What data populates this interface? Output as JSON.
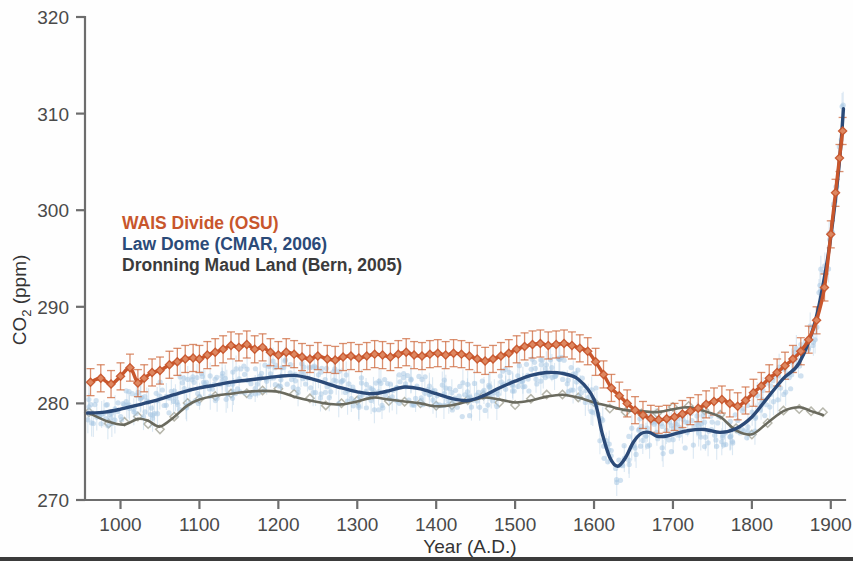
{
  "chart_data": {
    "type": "line",
    "title": "",
    "xlabel": "Year  (A.D.)",
    "ylabel": "CO 2 (ppm)",
    "ylabel_main": "CO",
    "ylabel_sub": "2",
    "ylabel_unit": " (ppm)",
    "xlim": [
      955,
      1918
    ],
    "ylim": [
      270,
      320
    ],
    "yticks": [
      270,
      280,
      290,
      300,
      310,
      320
    ],
    "xticks": [
      1000,
      1100,
      1200,
      1300,
      1400,
      1500,
      1600,
      1700,
      1800,
      1900
    ],
    "grid": false,
    "legend_position": "upper-left-inside",
    "colors": {
      "wais": "#C8562C",
      "wais_marker": "#CF6A3E",
      "lawdome_line": "#2B4A78",
      "lawdome_points": "#A9C9E4",
      "dml_line": "#6A6A5E",
      "dml_points": "#A9A99C",
      "axis": "#6D6D6D",
      "text": "#3A3A3A"
    },
    "series": [
      {
        "name": "WAIS Divide (OSU)",
        "short": "wais",
        "color": "#C8562C",
        "style": "markers-errorbars-smoothline",
        "marker": "diamond",
        "errorbar_ppm": 1.4,
        "x": [
          962,
          975,
          988,
          1000,
          1012,
          1022,
          1030,
          1040,
          1050,
          1062,
          1072,
          1082,
          1092,
          1100,
          1110,
          1120,
          1130,
          1140,
          1150,
          1160,
          1170,
          1180,
          1190,
          1200,
          1210,
          1220,
          1230,
          1240,
          1250,
          1262,
          1272,
          1282,
          1292,
          1302,
          1312,
          1322,
          1332,
          1342,
          1352,
          1362,
          1372,
          1382,
          1392,
          1402,
          1412,
          1422,
          1432,
          1442,
          1452,
          1462,
          1472,
          1482,
          1492,
          1502,
          1512,
          1522,
          1532,
          1542,
          1552,
          1562,
          1572,
          1582,
          1592,
          1602,
          1612,
          1622,
          1632,
          1642,
          1652,
          1662,
          1672,
          1682,
          1692,
          1702,
          1712,
          1722,
          1732,
          1742,
          1752,
          1762,
          1772,
          1782,
          1792,
          1802,
          1812,
          1822,
          1832,
          1842,
          1852,
          1862,
          1872,
          1882,
          1892,
          1900,
          1906,
          1911,
          1915
        ],
        "y": [
          282.2,
          282.6,
          282.0,
          282.8,
          283.7,
          282.1,
          282.6,
          283.2,
          283.4,
          284.0,
          284.3,
          284.6,
          284.7,
          284.6,
          285.0,
          285.3,
          285.6,
          286.0,
          285.8,
          286.1,
          285.6,
          285.8,
          285.3,
          285.0,
          285.3,
          285.1,
          284.8,
          284.6,
          284.9,
          284.6,
          284.5,
          284.8,
          284.9,
          284.7,
          284.9,
          285.1,
          285.0,
          284.8,
          285.1,
          285.3,
          285.0,
          284.9,
          285.1,
          285.2,
          285.0,
          285.2,
          285.1,
          284.9,
          284.6,
          284.4,
          284.6,
          284.9,
          285.2,
          285.6,
          285.9,
          286.1,
          286.2,
          286.0,
          286.1,
          286.2,
          286.0,
          285.7,
          285.4,
          284.3,
          283.0,
          281.6,
          280.8,
          280.0,
          279.3,
          278.8,
          278.4,
          278.3,
          278.4,
          278.6,
          278.9,
          279.2,
          279.5,
          279.9,
          280.2,
          280.4,
          280.0,
          279.7,
          280.3,
          281.1,
          281.8,
          282.6,
          283.2,
          283.9,
          284.6,
          285.4,
          286.6,
          288.6,
          292.0,
          297.5,
          301.8,
          305.4,
          308.2
        ]
      },
      {
        "name": "Law Dome (CMAR, 2006)",
        "short": "lawdome",
        "color": "#2B4A78",
        "style": "scatter-with-smoothline",
        "marker": "dot",
        "x": [
          958,
          980,
          1000,
          1020,
          1040,
          1060,
          1080,
          1100,
          1120,
          1140,
          1160,
          1180,
          1200,
          1220,
          1240,
          1260,
          1280,
          1300,
          1320,
          1340,
          1360,
          1380,
          1400,
          1420,
          1440,
          1460,
          1480,
          1500,
          1520,
          1540,
          1560,
          1580,
          1600,
          1610,
          1620,
          1630,
          1640,
          1650,
          1660,
          1670,
          1680,
          1690,
          1700,
          1720,
          1740,
          1760,
          1780,
          1800,
          1820,
          1840,
          1860,
          1880,
          1895,
          1905,
          1912,
          1916
        ],
        "y": [
          279.0,
          279.1,
          279.4,
          279.8,
          280.2,
          280.7,
          281.2,
          281.6,
          281.9,
          282.2,
          282.4,
          282.6,
          282.8,
          282.9,
          282.6,
          282.1,
          281.6,
          281.2,
          281.0,
          281.3,
          281.7,
          281.5,
          281.0,
          280.5,
          280.3,
          280.8,
          281.6,
          282.3,
          282.9,
          283.2,
          283.1,
          282.5,
          280.4,
          277.0,
          274.4,
          273.5,
          274.4,
          276.0,
          276.9,
          277.0,
          276.6,
          276.6,
          276.8,
          277.2,
          277.3,
          277.0,
          277.4,
          278.6,
          280.6,
          282.6,
          284.2,
          288.4,
          294.5,
          300.5,
          306.0,
          310.5
        ]
      },
      {
        "name": "Dronning Maud Land (Bern, 2005)",
        "short": "dml",
        "color": "#6A6A5E",
        "style": "markers-with-smoothline",
        "marker": "open-diamond",
        "x": [
          960,
          985,
          1005,
          1022,
          1035,
          1050,
          1068,
          1085,
          1100,
          1120,
          1140,
          1160,
          1180,
          1200,
          1220,
          1240,
          1260,
          1280,
          1300,
          1320,
          1340,
          1360,
          1380,
          1400,
          1420,
          1440,
          1460,
          1480,
          1500,
          1520,
          1540,
          1560,
          1580,
          1600,
          1620,
          1640,
          1660,
          1680,
          1700,
          1720,
          1740,
          1760,
          1780,
          1800,
          1820,
          1840,
          1860,
          1875,
          1890
        ],
        "y": [
          279.0,
          278.1,
          277.8,
          278.4,
          278.2,
          277.6,
          278.6,
          279.8,
          280.4,
          280.8,
          281.0,
          281.2,
          281.3,
          281.2,
          280.7,
          280.3,
          280.0,
          279.9,
          280.2,
          280.6,
          280.4,
          280.2,
          280.0,
          279.7,
          279.8,
          280.2,
          280.6,
          280.4,
          280.1,
          280.3,
          280.7,
          280.9,
          280.6,
          280.1,
          279.7,
          279.3,
          279.2,
          279.1,
          279.4,
          279.6,
          279.2,
          278.6,
          277.2,
          276.8,
          278.0,
          279.2,
          279.6,
          279.2,
          278.8
        ]
      }
    ]
  },
  "legend": {
    "entries": [
      {
        "label": "WAIS Divide (OSU)",
        "color": "#C8562C"
      },
      {
        "label": "Law Dome (CMAR, 2006)",
        "color": "#2B4A78"
      },
      {
        "label": "Dronning Maud Land (Bern, 2005)",
        "color": "#3B3B3B"
      }
    ]
  },
  "axes": {
    "x_title": "Year  (A.D.)",
    "y_title_main": "CO",
    "y_title_sub": "2",
    "y_title_rest": " (ppm)",
    "y_labels": [
      "320",
      "310",
      "300",
      "290",
      "280",
      "270"
    ],
    "x_labels": [
      "1000",
      "1100",
      "1200",
      "1300",
      "1400",
      "1500",
      "1600",
      "1700",
      "1800",
      "1900"
    ]
  }
}
